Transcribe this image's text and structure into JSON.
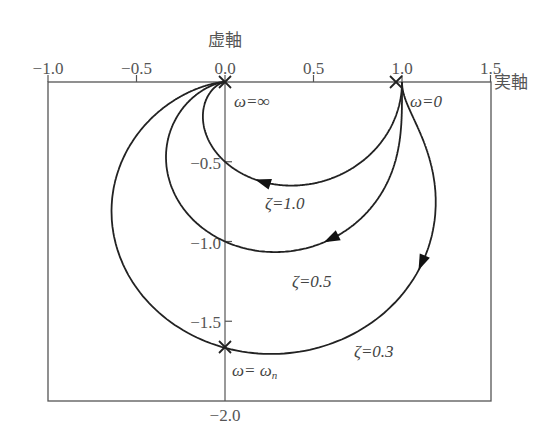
{
  "chart_data": {
    "type": "line",
    "title": "",
    "xlabel": "実軸",
    "ylabel": "虚軸",
    "xlim": [
      -1.0,
      1.5
    ],
    "ylim": [
      -2.0,
      0.0
    ],
    "grid": false,
    "x_ticks": [
      -1.0,
      -0.5,
      0.0,
      0.5,
      1.0,
      1.5
    ],
    "x_tick_labels": [
      "−1.0",
      "−0.5",
      "0.0",
      "0.5",
      "1.0",
      "1.5"
    ],
    "y_ticks": [
      -0.5,
      -1.0,
      -1.5,
      -2.0
    ],
    "y_tick_labels": [
      "−0.5",
      "−1.0",
      "−1.5",
      "−2.0"
    ],
    "series": [
      {
        "name": "ζ=1.0",
        "zeta": 1.0,
        "label": "ζ=1.0",
        "points": [
          [
            1.0,
            0.0
          ],
          [
            0.96,
            -0.2
          ],
          [
            0.74,
            -0.46
          ],
          [
            0.5,
            -0.5
          ],
          [
            0.21,
            -0.41
          ],
          [
            0.06,
            -0.23
          ],
          [
            0.0,
            0.0
          ]
        ]
      },
      {
        "name": "ζ=0.5",
        "zeta": 0.5,
        "label": "ζ=0.5",
        "points": [
          [
            1.0,
            0.0
          ],
          [
            1.03,
            -0.26
          ],
          [
            0.87,
            -0.69
          ],
          [
            0.0,
            -1.0
          ],
          [
            -0.38,
            -0.62
          ],
          [
            -0.3,
            -0.23
          ],
          [
            0.0,
            0.0
          ]
        ]
      },
      {
        "name": "ζ=0.3",
        "zeta": 0.3,
        "label": "ζ=0.3",
        "points": [
          [
            1.0,
            0.0
          ],
          [
            1.1,
            -0.22
          ],
          [
            1.3,
            -0.73
          ],
          [
            0.0,
            -1.667
          ],
          [
            -0.68,
            -0.94
          ],
          [
            -0.52,
            -0.28
          ],
          [
            0.0,
            0.0
          ]
        ]
      }
    ],
    "annotations": [
      {
        "text": "ω=∞",
        "x": 0.0,
        "y": 0.0,
        "marker": "x"
      },
      {
        "text": "ω=0",
        "x": 1.0,
        "y": 0.0,
        "marker": "x"
      },
      {
        "text": "ω=ωn",
        "x": 0.0,
        "y": -1.667,
        "marker": "x"
      },
      {
        "text": "ζ=1.0",
        "x": 0.35,
        "y": -0.7
      },
      {
        "text": "ζ=0.5",
        "x": 0.6,
        "y": -1.3
      },
      {
        "text": "ζ=0.3",
        "x": 0.85,
        "y": -1.8
      }
    ]
  },
  "labels": {
    "imag_axis": "虚軸",
    "real_axis": "実軸",
    "omega_inf": "ω=∞",
    "omega_zero": "ω=0",
    "omega_n_prefix": "ω= ω",
    "omega_n_sub": "n",
    "zeta_1": "ζ=1.0",
    "zeta_05": "ζ=0.5",
    "zeta_03": "ζ=0.3"
  }
}
